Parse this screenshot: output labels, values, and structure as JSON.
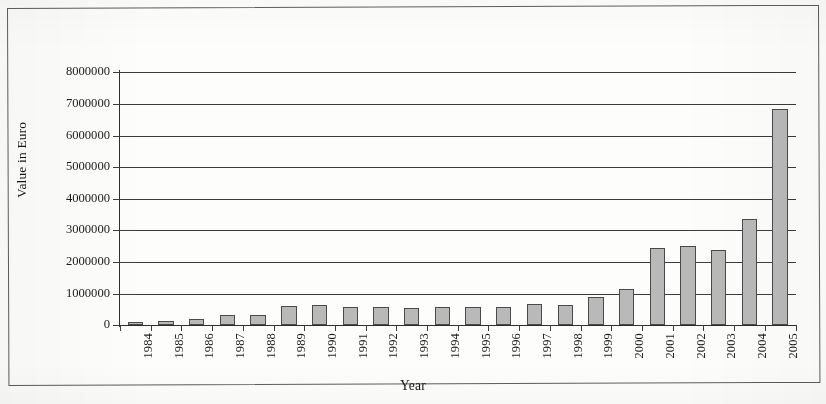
{
  "figure": {
    "kind": "scanned-bar-chart",
    "background_color": "#fdfdfb",
    "frame_color": "#5d5d5d"
  },
  "chart_data": {
    "type": "bar",
    "title": "",
    "xlabel": "Year",
    "ylabel": "Value in Euro",
    "categories": [
      "1984",
      "1985",
      "1986",
      "1987",
      "1988",
      "1989",
      "1990",
      "1991",
      "1992",
      "1993",
      "1994",
      "1995",
      "1996",
      "1997",
      "1998",
      "1999",
      "2000",
      "2001",
      "2002",
      "2003",
      "2004",
      "2005"
    ],
    "values": [
      110000,
      130000,
      190000,
      330000,
      310000,
      610000,
      640000,
      590000,
      580000,
      540000,
      560000,
      560000,
      590000,
      660000,
      650000,
      880000,
      1150000,
      2450000,
      2510000,
      2380000,
      3350000,
      6850000
    ],
    "ylim": [
      0,
      8000000
    ],
    "y_ticks": [
      0,
      1000000,
      2000000,
      3000000,
      4000000,
      5000000,
      6000000,
      7000000,
      8000000
    ],
    "y_tick_labels": [
      "0",
      "1000000",
      "2000000",
      "3000000",
      "4000000",
      "5000000",
      "6000000",
      "7000000",
      "8000000"
    ],
    "grid": true,
    "grid_axis": "y",
    "legend": false,
    "legend_position": "none",
    "bar_fill_color": "#b9b9b9",
    "bar_edge_color": "#4a4a4a",
    "axis_color": "#2e2e2e",
    "gridline_color": "#3b3b3b",
    "x_tick_label_rotation": 90
  }
}
